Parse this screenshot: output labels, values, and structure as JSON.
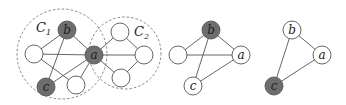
{
  "colors": {
    "background": "#ffffff",
    "edge": "#555555",
    "node_stroke": "#555555",
    "node_fill_light": "#ffffff",
    "node_fill_dark": "#6e6e6e",
    "dashed_circle": "#777777",
    "label_text": "#222222"
  },
  "diagrams": [
    {
      "name": "graph-communities",
      "communities": [
        {
          "label": "C",
          "subscript": "1",
          "cx": 62,
          "cy": 54,
          "r": 45,
          "label_x": 36,
          "label_y": 32
        },
        {
          "label": "C",
          "subscript": "2",
          "cx": 125,
          "cy": 53,
          "r": 36,
          "label_x": 134,
          "label_y": 36
        }
      ],
      "nodes": [
        {
          "id": "b",
          "label": "b",
          "x": 67,
          "y": 30,
          "shaded": true
        },
        {
          "id": "a",
          "label": "a",
          "x": 94,
          "y": 55,
          "shaded": true
        },
        {
          "id": "c",
          "label": "c",
          "x": 46,
          "y": 87,
          "shaded": true
        },
        {
          "id": "l",
          "label": "",
          "x": 34,
          "y": 54,
          "shaded": false
        },
        {
          "id": "m",
          "label": "",
          "x": 76,
          "y": 85,
          "shaded": false
        },
        {
          "id": "t2",
          "label": "",
          "x": 120,
          "y": 32,
          "shaded": false
        },
        {
          "id": "r2",
          "label": "",
          "x": 144,
          "y": 55,
          "shaded": false
        },
        {
          "id": "b2",
          "label": "",
          "x": 121,
          "y": 78,
          "shaded": false
        }
      ],
      "edges": [
        [
          "b",
          "l"
        ],
        [
          "b",
          "a"
        ],
        [
          "b",
          "c"
        ],
        [
          "l",
          "a"
        ],
        [
          "l",
          "m"
        ],
        [
          "c",
          "a"
        ],
        [
          "m",
          "a"
        ],
        [
          "a",
          "t2"
        ],
        [
          "a",
          "r2"
        ],
        [
          "a",
          "b2"
        ],
        [
          "t2",
          "r2"
        ],
        [
          "b2",
          "r2"
        ]
      ]
    },
    {
      "name": "graph-subgraph-abc",
      "communities": [],
      "nodes": [
        {
          "id": "b",
          "label": "b",
          "x": 211,
          "y": 30,
          "shaded": true
        },
        {
          "id": "a",
          "label": "a",
          "x": 241,
          "y": 55,
          "shaded": false
        },
        {
          "id": "c",
          "label": "c",
          "x": 193,
          "y": 86,
          "shaded": false
        },
        {
          "id": "l",
          "label": "",
          "x": 178,
          "y": 55,
          "shaded": false
        }
      ],
      "edges": [
        [
          "b",
          "l"
        ],
        [
          "b",
          "a"
        ],
        [
          "b",
          "c"
        ],
        [
          "l",
          "a"
        ],
        [
          "c",
          "a"
        ]
      ]
    },
    {
      "name": "graph-triangle",
      "communities": [],
      "nodes": [
        {
          "id": "b",
          "label": "b",
          "x": 292,
          "y": 30,
          "shaded": false
        },
        {
          "id": "a",
          "label": "a",
          "x": 322,
          "y": 55,
          "shaded": false
        },
        {
          "id": "c",
          "label": "c",
          "x": 274,
          "y": 86,
          "shaded": true
        }
      ],
      "edges": [
        [
          "b",
          "a"
        ],
        [
          "b",
          "c"
        ],
        [
          "c",
          "a"
        ]
      ]
    }
  ],
  "node_radius": 9
}
